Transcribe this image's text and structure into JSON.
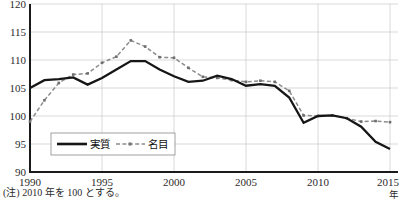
{
  "chart_data": {
    "type": "line",
    "title": "",
    "xlabel": "年",
    "ylabel": "",
    "xlim": [
      1990,
      2015
    ],
    "ylim": [
      90,
      120
    ],
    "ytick_labels": [
      "120",
      "115",
      "110",
      "105",
      "100",
      "95",
      "90"
    ],
    "yticks": [
      120,
      115,
      110,
      105,
      100,
      95,
      90
    ],
    "xtick_labels": [
      "1990",
      "1995",
      "2000",
      "2005",
      "2010",
      "2015"
    ],
    "xticks": [
      1990,
      1995,
      2000,
      2005,
      2010,
      2015
    ],
    "grid": true,
    "legend_position": "lower-left",
    "x": [
      1990,
      1991,
      1992,
      1993,
      1994,
      1995,
      1996,
      1997,
      1998,
      1999,
      2000,
      2001,
      2002,
      2003,
      2004,
      2005,
      2006,
      2007,
      2008,
      2009,
      2010,
      2011,
      2012,
      2013,
      2014,
      2015
    ],
    "series": [
      {
        "name": "実質",
        "style": "solid",
        "color": "#161616",
        "values": [
          105.0,
          106.4,
          106.6,
          106.9,
          105.6,
          106.8,
          108.3,
          109.8,
          109.8,
          108.3,
          107.1,
          106.1,
          106.3,
          107.2,
          106.6,
          105.4,
          105.7,
          105.4,
          103.3,
          98.8,
          100.0,
          100.1,
          99.6,
          98.1,
          95.4,
          94.1
        ]
      },
      {
        "name": "名目",
        "style": "dashed",
        "color": "#8c8c8c",
        "values": [
          99.0,
          102.8,
          105.9,
          107.4,
          107.6,
          109.5,
          110.6,
          113.5,
          112.4,
          110.5,
          110.4,
          108.6,
          107.0,
          106.8,
          106.4,
          106.1,
          106.3,
          106.1,
          104.5,
          100.1,
          100.0,
          100.1,
          99.6,
          99.0,
          99.1,
          98.9
        ]
      }
    ],
    "note": "(注) 2010 年を 100 とする。"
  },
  "footnote": {
    "text": "(注) 2010 年を 100 とする。"
  },
  "axis": {
    "x_unit": "年"
  },
  "legend": {
    "items": [
      {
        "label": "実質"
      },
      {
        "label": "名目"
      }
    ]
  }
}
